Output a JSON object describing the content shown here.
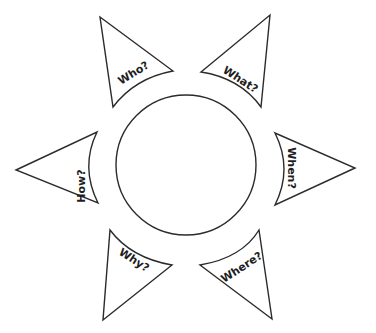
{
  "diagram": {
    "type": "sun-organizer",
    "stroke_color": "#2b2b2b",
    "text_color": "#1e1e1e",
    "background": "#ffffff",
    "center": {
      "shape": "circle",
      "label": "",
      "cx": 186,
      "cy": 165,
      "r": 70
    },
    "rays": [
      {
        "id": "who",
        "label": "Who?"
      },
      {
        "id": "what",
        "label": "What?"
      },
      {
        "id": "how",
        "label": "How?"
      },
      {
        "id": "when",
        "label": "When?"
      },
      {
        "id": "why",
        "label": "Why?"
      },
      {
        "id": "where",
        "label": "Where?"
      }
    ]
  }
}
